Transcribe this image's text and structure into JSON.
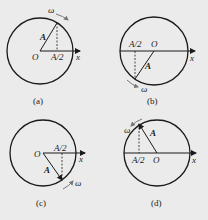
{
  "panels": [
    {
      "caption": "(a)",
      "omega": "ω",
      "amplitude": "A",
      "half": "A/2",
      "origin": "O",
      "axis": "x"
    },
    {
      "caption": "(b)",
      "omega": "ω",
      "amplitude": "A",
      "half": "A/2",
      "origin": "O",
      "axis": "x"
    },
    {
      "caption": "(c)",
      "omega": "ω",
      "amplitude": "A",
      "half": "A/2",
      "origin": "O",
      "axis": "x"
    },
    {
      "caption": "(d)",
      "omega": "ω",
      "amplitude": "A",
      "half": "A/2",
      "origin": "O",
      "axis": "x"
    }
  ],
  "colors": {
    "background": "#ebebeb",
    "stroke": "#1a1a1a",
    "omega_arrow": "#777777"
  }
}
